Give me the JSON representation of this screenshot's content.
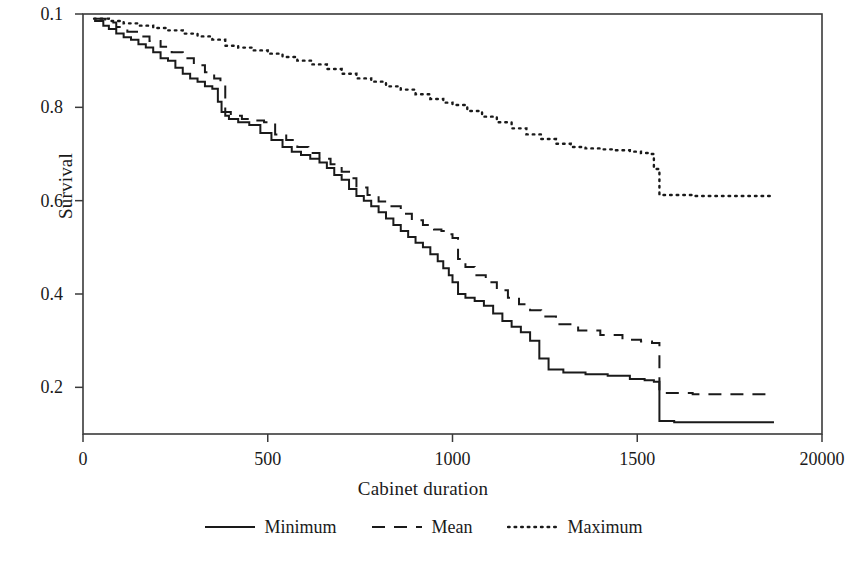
{
  "chart_data": {
    "type": "line",
    "title": "",
    "xlabel": "Cabinet duration",
    "ylabel": "Survival",
    "xlim": [
      0,
      2000
    ],
    "ylim": [
      0.1,
      1.0
    ],
    "grid": false,
    "legend_position": "bottom-center",
    "xticks": [
      0,
      500,
      1000,
      1500,
      2000
    ],
    "xtick_labels": [
      "0",
      "500",
      "1000",
      "1500",
      "20000"
    ],
    "yticks": [
      0.2,
      0.4,
      0.6,
      0.8,
      1.0
    ],
    "ytick_labels": [
      "0.2",
      "0.4",
      "0.6",
      "0.8",
      "0.1"
    ],
    "series": [
      {
        "name": "Minimum",
        "style": "solid",
        "color": "#1a1a1a",
        "x": [
          30,
          55,
          70,
          90,
          110,
          130,
          150,
          170,
          190,
          210,
          230,
          250,
          270,
          290,
          310,
          330,
          350,
          365,
          375,
          385,
          395,
          420,
          450,
          480,
          510,
          540,
          565,
          590,
          615,
          640,
          660,
          680,
          700,
          720,
          740,
          760,
          780,
          800,
          820,
          840,
          860,
          880,
          900,
          920,
          940,
          960,
          975,
          990,
          1000,
          1015,
          1035,
          1060,
          1085,
          1110,
          1135,
          1160,
          1185,
          1210,
          1235,
          1260,
          1300,
          1360,
          1420,
          1480,
          1520,
          1545,
          1560,
          1600,
          1700,
          1800,
          1870
        ],
        "y": [
          0.985,
          0.975,
          0.968,
          0.958,
          0.95,
          0.945,
          0.935,
          0.928,
          0.918,
          0.905,
          0.9,
          0.885,
          0.872,
          0.862,
          0.855,
          0.845,
          0.84,
          0.812,
          0.79,
          0.782,
          0.775,
          0.768,
          0.762,
          0.745,
          0.73,
          0.715,
          0.705,
          0.698,
          0.69,
          0.682,
          0.67,
          0.655,
          0.645,
          0.625,
          0.61,
          0.6,
          0.588,
          0.575,
          0.562,
          0.548,
          0.535,
          0.522,
          0.51,
          0.5,
          0.485,
          0.47,
          0.455,
          0.44,
          0.425,
          0.4,
          0.392,
          0.385,
          0.375,
          0.358,
          0.342,
          0.33,
          0.318,
          0.3,
          0.262,
          0.238,
          0.232,
          0.228,
          0.225,
          0.218,
          0.215,
          0.212,
          0.128,
          0.125,
          0.125,
          0.125,
          0.125
        ]
      },
      {
        "name": "Mean",
        "style": "dashed",
        "color": "#1a1a1a",
        "x": [
          30,
          60,
          90,
          120,
          150,
          180,
          210,
          240,
          270,
          300,
          330,
          355,
          372,
          385,
          400,
          430,
          460,
          490,
          520,
          550,
          580,
          610,
          640,
          670,
          700,
          720,
          740,
          770,
          800,
          830,
          860,
          890,
          920,
          950,
          970,
          990,
          1000,
          1015,
          1035,
          1060,
          1090,
          1120,
          1150,
          1180,
          1210,
          1240,
          1280,
          1340,
          1400,
          1460,
          1510,
          1540,
          1560,
          1650,
          1750,
          1870
        ],
        "y": [
          0.99,
          0.982,
          0.972,
          0.962,
          0.952,
          0.942,
          0.93,
          0.918,
          0.905,
          0.89,
          0.875,
          0.862,
          0.85,
          0.79,
          0.782,
          0.775,
          0.772,
          0.768,
          0.742,
          0.73,
          0.715,
          0.702,
          0.69,
          0.678,
          0.662,
          0.648,
          0.628,
          0.612,
          0.598,
          0.588,
          0.572,
          0.558,
          0.548,
          0.538,
          0.535,
          0.528,
          0.52,
          0.475,
          0.458,
          0.44,
          0.425,
          0.408,
          0.392,
          0.378,
          0.365,
          0.352,
          0.335,
          0.322,
          0.312,
          0.302,
          0.298,
          0.295,
          0.188,
          0.185,
          0.185,
          0.185
        ]
      },
      {
        "name": "Maximum",
        "style": "dotted",
        "color": "#1a1a1a",
        "x": [
          30,
          70,
          110,
          150,
          190,
          230,
          270,
          310,
          350,
          385,
          420,
          460,
          500,
          540,
          580,
          620,
          660,
          700,
          740,
          780,
          820,
          860,
          900,
          940,
          975,
          1000,
          1040,
          1080,
          1120,
          1160,
          1200,
          1240,
          1280,
          1320,
          1360,
          1400,
          1440,
          1480,
          1510,
          1530,
          1545,
          1560,
          1650,
          1750,
          1870
        ],
        "y": [
          0.99,
          0.985,
          0.98,
          0.975,
          0.97,
          0.965,
          0.958,
          0.952,
          0.945,
          0.932,
          0.928,
          0.922,
          0.915,
          0.908,
          0.9,
          0.892,
          0.882,
          0.872,
          0.862,
          0.855,
          0.845,
          0.838,
          0.828,
          0.818,
          0.81,
          0.805,
          0.792,
          0.78,
          0.768,
          0.755,
          0.742,
          0.732,
          0.722,
          0.715,
          0.712,
          0.71,
          0.708,
          0.705,
          0.702,
          0.7,
          0.668,
          0.612,
          0.61,
          0.61,
          0.61
        ]
      }
    ]
  },
  "legend": {
    "items": [
      {
        "label": "Minimum",
        "style": "solid"
      },
      {
        "label": "Mean",
        "style": "dashed"
      },
      {
        "label": "Maximum",
        "style": "dotted"
      }
    ]
  }
}
